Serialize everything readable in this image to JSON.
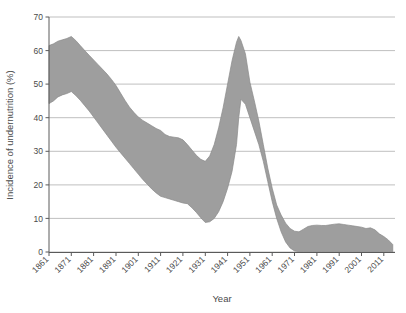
{
  "chart_data": {
    "type": "area",
    "title": "",
    "subtitle": "",
    "xlabel": "Year",
    "ylabel": "Incidence of undernutrition (%)",
    "xlim": [
      1861,
      2016
    ],
    "ylim": [
      0,
      70
    ],
    "yticks": [
      0,
      10,
      20,
      30,
      40,
      50,
      60,
      70
    ],
    "xticks": [
      1861,
      1871,
      1881,
      1891,
      1901,
      1911,
      1921,
      1931,
      1941,
      1951,
      1961,
      1971,
      1981,
      1991,
      2001,
      2011
    ],
    "xtick_labels": [
      "1861",
      "1871",
      "1881",
      "1891",
      "1901",
      "1911",
      "1921",
      "1931",
      "1941",
      "1951",
      "1961",
      "1971",
      "1981",
      "1991",
      "2001",
      "2011"
    ],
    "grid": true,
    "grid_axis": "y",
    "legend": null,
    "band_color": "#9e9e9e",
    "band_label": "Estimated range of undernutrition incidence",
    "x": [
      1861,
      1863,
      1865,
      1867,
      1869,
      1871,
      1873,
      1875,
      1877,
      1879,
      1881,
      1883,
      1885,
      1887,
      1889,
      1891,
      1893,
      1895,
      1897,
      1899,
      1901,
      1903,
      1905,
      1907,
      1909,
      1911,
      1913,
      1915,
      1917,
      1919,
      1921,
      1923,
      1925,
      1927,
      1929,
      1931,
      1933,
      1935,
      1937,
      1939,
      1941,
      1943,
      1945,
      1946,
      1947,
      1949,
      1951,
      1953,
      1955,
      1957,
      1959,
      1961,
      1963,
      1965,
      1967,
      1969,
      1971,
      1973,
      1975,
      1977,
      1979,
      1981,
      1983,
      1985,
      1987,
      1989,
      1991,
      1993,
      1995,
      1997,
      1999,
      2001,
      2003,
      2005,
      2007,
      2009,
      2011,
      2013,
      2015
    ],
    "series": [
      {
        "name": "Upper bound",
        "values": [
          61.5,
          62.0,
          62.8,
          63.2,
          63.6,
          64.2,
          63.0,
          61.5,
          60.0,
          58.6,
          57.2,
          55.8,
          54.4,
          53.0,
          51.4,
          49.6,
          47.4,
          45.2,
          43.2,
          41.6,
          40.2,
          39.2,
          38.4,
          37.6,
          36.8,
          36.2,
          35.0,
          34.4,
          34.2,
          34.0,
          33.4,
          32.0,
          30.4,
          28.8,
          27.6,
          27.0,
          28.6,
          32.0,
          37.0,
          43.0,
          50.0,
          57.0,
          62.5,
          64.2,
          63.0,
          59.0,
          50.6,
          45.0,
          39.0,
          32.0,
          25.0,
          19.0,
          14.0,
          11.0,
          8.6,
          7.0,
          6.2,
          6.0,
          6.8,
          7.6,
          7.9,
          8.0,
          7.9,
          7.9,
          8.1,
          8.3,
          8.4,
          8.2,
          8.0,
          7.8,
          7.6,
          7.4,
          7.0,
          7.2,
          6.6,
          5.4,
          4.6,
          3.6,
          2.2
        ]
      },
      {
        "name": "Lower bound",
        "values": [
          44.2,
          45.0,
          46.2,
          46.8,
          47.2,
          47.8,
          46.6,
          45.2,
          43.6,
          42.0,
          40.2,
          38.4,
          36.6,
          34.8,
          33.0,
          31.2,
          29.6,
          28.0,
          26.4,
          24.8,
          23.2,
          21.6,
          20.2,
          18.8,
          17.6,
          16.6,
          16.2,
          15.8,
          15.4,
          15.0,
          14.6,
          14.4,
          13.2,
          11.8,
          10.2,
          8.8,
          9.0,
          10.0,
          12.0,
          15.0,
          19.0,
          24.0,
          32.0,
          40.0,
          45.5,
          44.0,
          40.0,
          36.0,
          32.0,
          27.0,
          21.0,
          15.0,
          10.0,
          6.0,
          3.0,
          1.2,
          0.3,
          0.1,
          0.1,
          0.1,
          0.1,
          0.1,
          0.1,
          0.1,
          0.1,
          0.1,
          0.1,
          0.1,
          0.1,
          0.1,
          0.1,
          0.1,
          0.1,
          0.1,
          0.1,
          0.1,
          0.1,
          0.1,
          0.1
        ]
      }
    ]
  },
  "axes": {
    "ylabel": "Incidence of undernutrition (%)",
    "xlabel": "Year"
  },
  "colors": {
    "band": "#9e9e9e",
    "band_edge": "#8a8a8a",
    "axis": "#5a5a5a",
    "grid": "#b8b8b8",
    "text": "#4a4a4a",
    "background": "#ffffff"
  }
}
